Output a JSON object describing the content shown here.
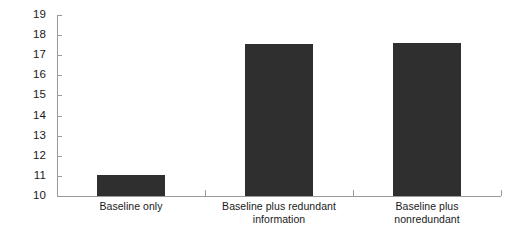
{
  "chart_data": {
    "type": "bar",
    "title": "",
    "subtitle": "",
    "xlabel": "",
    "ylabel": "",
    "categories": [
      "Baseline only",
      "Baseline plus redundant information",
      "Baseline plus nonredundant"
    ],
    "category_lines": [
      [
        "Baseline only"
      ],
      [
        "Baseline plus redundant",
        "information"
      ],
      [
        "Baseline plus",
        "nonredundant"
      ]
    ],
    "values": [
      11.05,
      17.55,
      17.6
    ],
    "ylim": [
      10,
      19
    ],
    "yticks": [
      10,
      11,
      12,
      13,
      14,
      15,
      16,
      17,
      18,
      19
    ],
    "ytick_labels": [
      "10",
      "11",
      "12",
      "13",
      "14",
      "15",
      "16",
      "17",
      "18",
      "19"
    ],
    "grid": false,
    "legend": null,
    "legend_position": "none",
    "bar_color": "#2f2f2f",
    "axis_color": "#9a9a9a",
    "background_color": "#ffffff",
    "text_color": "#1a1a1a"
  }
}
